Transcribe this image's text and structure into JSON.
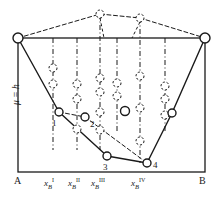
{
  "figure": {
    "type": "phase-diagram",
    "axis_label_y": "μ = h",
    "endpoint_left": "A",
    "endpoint_right": "B",
    "frame": {
      "x0": 18,
      "y0": 38,
      "x1": 205,
      "y1": 172
    },
    "colors": {
      "stroke": "#1a1a1a",
      "background": "#ffffff",
      "node_fill": "#ffffff"
    }
  },
  "tick_labels": [
    {
      "text": "x",
      "sub": "B",
      "sup": "I",
      "x": 53
    },
    {
      "text": "x",
      "sub": "B",
      "sup": "II",
      "x": 77
    },
    {
      "text": "x",
      "sub": "B",
      "sup": "III",
      "x": 100
    },
    {
      "text": "x",
      "sub": "B",
      "sup": "IV",
      "x": 140
    }
  ],
  "vertical_lines": [
    {
      "x": 53,
      "y_top": 38,
      "y_bottom": 150
    },
    {
      "x": 77,
      "y_top": 38,
      "y_bottom": 150
    },
    {
      "x": 100,
      "y_top": 14,
      "y_bottom": 150
    },
    {
      "x": 117,
      "y_top": 38,
      "y_bottom": 132
    },
    {
      "x": 140,
      "y_top": 18,
      "y_bottom": 163
    },
    {
      "x": 165,
      "y_top": 38,
      "y_bottom": 132
    }
  ],
  "solid_nodes": [
    {
      "id": "A",
      "x": 18,
      "y": 38,
      "r": 5,
      "label": ""
    },
    {
      "id": "B",
      "x": 205,
      "y": 38,
      "r": 5,
      "label": ""
    },
    {
      "id": "1",
      "x": 59,
      "y": 112,
      "r": 4,
      "label": "1",
      "lx": 52,
      "ly": 119
    },
    {
      "id": "2",
      "x": 85,
      "y": 117,
      "r": 4,
      "label": "2",
      "lx": 90,
      "ly": 120
    },
    {
      "id": "3",
      "x": 107,
      "y": 156,
      "r": 4,
      "label": "3",
      "lx": 103,
      "ly": 163
    },
    {
      "id": "4",
      "x": 147,
      "y": 163,
      "r": 4,
      "label": "4",
      "lx": 153,
      "ly": 161
    },
    {
      "id": "R",
      "x": 172,
      "y": 113,
      "r": 4,
      "label": ""
    },
    {
      "id": "Cmid",
      "x": 125,
      "y": 111,
      "r": 4.5,
      "label": ""
    }
  ],
  "dashed_nodes": [
    {
      "x": 100,
      "y": 14
    },
    {
      "x": 140,
      "y": 18
    },
    {
      "x": 53,
      "y": 68
    },
    {
      "x": 53,
      "y": 84
    },
    {
      "x": 77,
      "y": 84
    },
    {
      "x": 77,
      "y": 99
    },
    {
      "x": 77,
      "y": 129
    },
    {
      "x": 100,
      "y": 78
    },
    {
      "x": 100,
      "y": 92
    },
    {
      "x": 100,
      "y": 112
    },
    {
      "x": 100,
      "y": 130
    },
    {
      "x": 117,
      "y": 83
    },
    {
      "x": 117,
      "y": 96
    },
    {
      "x": 140,
      "y": 76
    },
    {
      "x": 140,
      "y": 108
    },
    {
      "x": 140,
      "y": 141
    },
    {
      "x": 165,
      "y": 86
    },
    {
      "x": 165,
      "y": 99
    },
    {
      "x": 165,
      "y": 115
    }
  ],
  "solid_path": [
    {
      "x": 18,
      "y": 38
    },
    {
      "x": 59,
      "y": 112
    },
    {
      "x": 107,
      "y": 156
    },
    {
      "x": 147,
      "y": 163
    },
    {
      "x": 172,
      "y": 113
    },
    {
      "x": 205,
      "y": 38
    }
  ],
  "dashed_upper_path": [
    {
      "x": 18,
      "y": 38
    },
    {
      "x": 100,
      "y": 14
    },
    {
      "x": 140,
      "y": 18
    },
    {
      "x": 205,
      "y": 38
    }
  ],
  "dashed_lower_path": [
    {
      "x": 59,
      "y": 112
    },
    {
      "x": 85,
      "y": 117
    },
    {
      "x": 147,
      "y": 163
    }
  ],
  "dashed_extra": [
    {
      "x1": 140,
      "y1": 22,
      "x2": 132,
      "y2": 38
    },
    {
      "x1": 100,
      "y1": 18,
      "x2": 104,
      "y2": 38
    }
  ]
}
